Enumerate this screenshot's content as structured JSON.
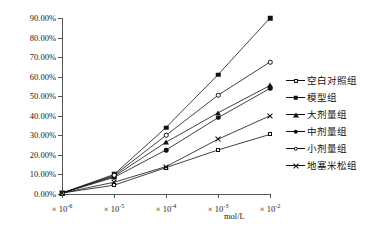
{
  "chart_data": {
    "type": "line",
    "title": "",
    "subtitle": "",
    "xlabel": "mol/L",
    "ylabel": "",
    "x_tick_labels": [
      "× 10⁻⁶",
      "× 10⁻⁵",
      "× 10⁻⁴",
      "× 10⁻³",
      "× 10⁻²"
    ],
    "x_tick_mantissa": "× 10",
    "x_exponents": [
      "-6",
      "-5",
      "-4",
      "-3",
      "-2"
    ],
    "y_tick_labels": [
      "0.00%",
      "10.00%",
      "20.00%",
      "30.00%",
      "40.00%",
      "50.00%",
      "60.00%",
      "70.00%",
      "80.00%",
      "90.00%"
    ],
    "y_tick_values": [
      0,
      10,
      20,
      30,
      40,
      50,
      60,
      70,
      80,
      90
    ],
    "ylim": [
      0,
      90
    ],
    "grid": false,
    "legend_position": "right",
    "categories": [
      "× 10⁻⁶",
      "× 10⁻⁵",
      "× 10⁻⁴",
      "× 10⁻³",
      "× 10⁻²"
    ],
    "series": [
      {
        "name": "空白对照组",
        "marker": "open-square",
        "color": "#111111",
        "values": [
          0.5,
          4.5,
          13.5,
          22.5,
          30.5
        ]
      },
      {
        "name": "模型组",
        "marker": "filled-square",
        "color": "#111111",
        "values": [
          0.5,
          10.0,
          34.0,
          61.0,
          90.0
        ]
      },
      {
        "name": "大剂量组",
        "marker": "filled-triangle",
        "color": "#111111",
        "values": [
          0.5,
          9.0,
          26.5,
          41.5,
          55.5
        ]
      },
      {
        "name": "中剂量组",
        "marker": "filled-circle",
        "color": "#111111",
        "values": [
          0.5,
          8.5,
          22.5,
          39.0,
          54.0
        ]
      },
      {
        "name": "小剂量组",
        "marker": "open-circle",
        "color": "#111111",
        "values": [
          0.5,
          9.5,
          30.0,
          50.5,
          67.5
        ]
      },
      {
        "name": "地塞米松组",
        "marker": "cross",
        "color": "#111111",
        "values": [
          0.5,
          6.0,
          14.0,
          28.0,
          40.0
        ]
      }
    ]
  }
}
